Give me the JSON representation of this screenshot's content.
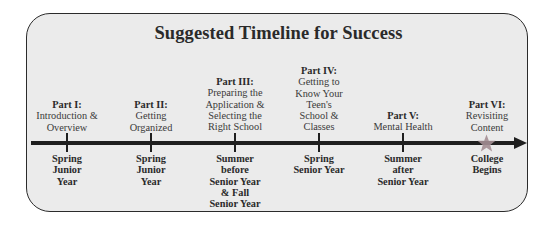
{
  "title": "Suggested Timeline for Success",
  "colors": {
    "panel_fill": "#ebebeb",
    "panel_border": "#2b2b2b",
    "line": "#1f1f1f",
    "star": "#a48e93"
  },
  "milestones": [
    {
      "part": "Part I:",
      "description": "Introduction &\nOverview",
      "when": "Spring\nJunior\nYear",
      "marker": "tick"
    },
    {
      "part": "Part II:",
      "description": "Getting\nOrganized",
      "when": "Spring\nJunior\nYear",
      "marker": "tick"
    },
    {
      "part": "Part III:",
      "description": "Preparing the\nApplication &\nSelecting the\nRight School",
      "when": "Summer\nbefore\nSenior Year\n& Fall\nSenior Year",
      "marker": "tick"
    },
    {
      "part": "Part IV:",
      "description": "Getting to\nKnow Your\nTeen's\nSchool &\nClasses",
      "when": "Spring\nSenior Year",
      "marker": "tick"
    },
    {
      "part": "Part V:",
      "description": "Mental Health",
      "when": "Summer\nafter\nSenior Year",
      "marker": "tick"
    },
    {
      "part": "Part VI:",
      "description": "Revisiting\nContent",
      "when": "College\nBegins",
      "marker": "star-icon"
    }
  ]
}
